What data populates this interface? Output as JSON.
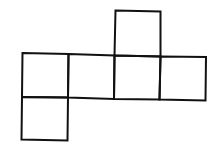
{
  "diagram": {
    "type": "cube-net",
    "stroke_color": "#111111",
    "background": "#ffffff",
    "squares": [
      {
        "id": "top",
        "row": 0,
        "col": 2
      },
      {
        "id": "row1-col0",
        "row": 1,
        "col": 0
      },
      {
        "id": "row1-col1",
        "row": 1,
        "col": 1
      },
      {
        "id": "row1-col2",
        "row": 1,
        "col": 2
      },
      {
        "id": "row1-col3",
        "row": 1,
        "col": 3
      },
      {
        "id": "bottom",
        "row": 2,
        "col": 0
      }
    ]
  }
}
